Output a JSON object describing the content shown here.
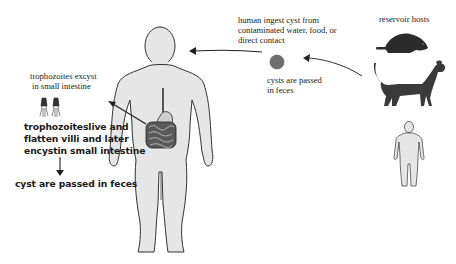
{
  "diagram": {
    "labels": {
      "human_ingest": [
        "human ingest cyst from",
        "contaminated water, food, or",
        "direct contact"
      ],
      "reservoir_hosts": "reservoir hosts",
      "cysts_passed": [
        "cysts are passed",
        "in feces"
      ],
      "trophozoites_excyst": [
        "trophozoites excyst",
        "in small intestine"
      ],
      "trophozoites_live": [
        "trophozoiteslive and",
        "flatten villi and later",
        "encystin small intestine"
      ],
      "cyst_passed_feces": "cyst are passed in feces"
    },
    "icons": {
      "human_body": "large-human-figure",
      "intestine": "intestine",
      "cyst": "cyst",
      "trophozoites": "trophozoites",
      "beaver": "beaver",
      "dog": "dog",
      "small_human": "small-human-figure"
    },
    "colors": {
      "body_fill": "#e6e6e6",
      "outline": "#333333",
      "cyst": "#6e6e6e",
      "animal": "#2b2b2b",
      "dog": "#3a3a3a",
      "arrow": "#222222"
    }
  }
}
